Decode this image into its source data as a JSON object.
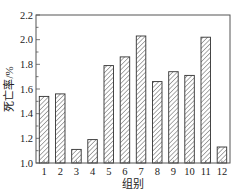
{
  "chart_data": {
    "type": "bar",
    "title": "",
    "xlabel": "组别",
    "ylabel": "死亡率/%",
    "categories": [
      "1",
      "2",
      "3",
      "4",
      "5",
      "6",
      "7",
      "8",
      "9",
      "10",
      "11",
      "12"
    ],
    "values": [
      1.54,
      1.56,
      1.11,
      1.19,
      1.79,
      1.86,
      2.03,
      1.66,
      1.74,
      1.71,
      2.02,
      1.13
    ],
    "ylim": [
      1.0,
      2.2
    ],
    "yticks": [
      "1.0",
      "1.2",
      "1.4",
      "1.6",
      "1.8",
      "2.0",
      "2.2"
    ],
    "y_minor_step": 0.1,
    "grid": false,
    "legend": null,
    "bar_fill": "hatched diagonal",
    "colors": {
      "bar_stroke": "#333333",
      "axis": "#444444",
      "background": "#ffffff"
    }
  }
}
